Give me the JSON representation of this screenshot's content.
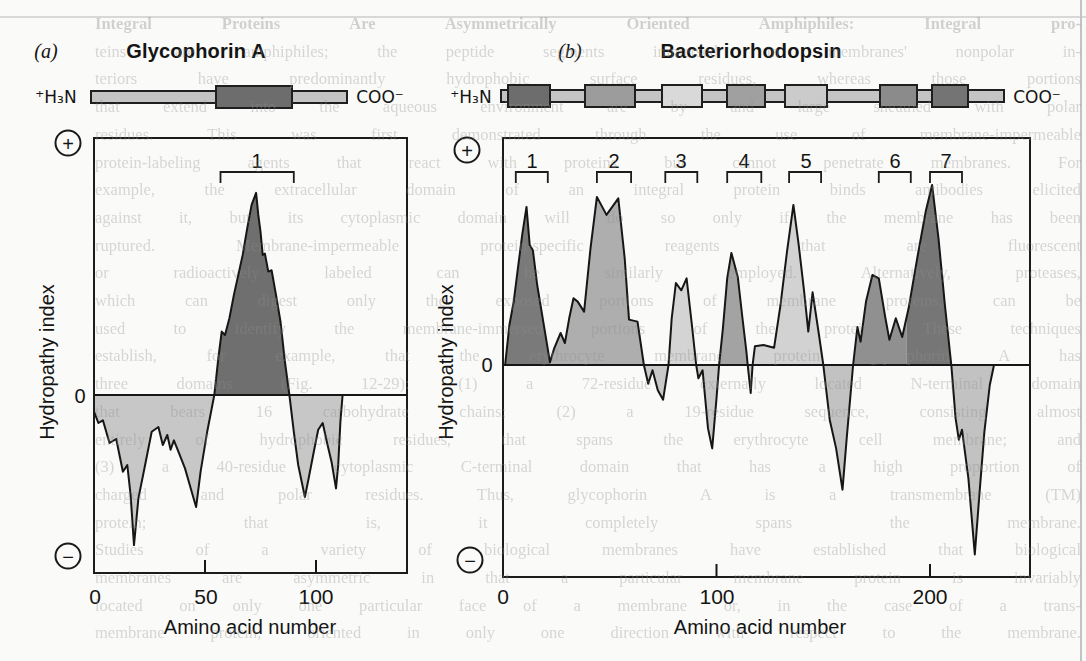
{
  "page": {
    "background": "#fafaf8",
    "bleed_lines": [
      "Integral Proteins Are Asymmetrically Oriented Amphiphiles: Integral pro-",
      "teins are amphiphiles; the peptide segments immersed in membranes' nonpolar in-",
      "teriors have predominantly hydrophobic surface residues, whereas those portions",
      "that extend into the aqueous environment are by and large sheathed with polar",
      "residues. This was first demonstrated through the use of membrane-impermeable",
      "protein-labeling agents that react with proteins but cannot penetrate membranes. For",
      "example, the extracellular domain of an integral protein binds antibodies elicited",
      "against it, but its cytoplasmic domain will do so only if the membrane has been",
      "ruptured. Membrane-impermeable protein-specific reagents that are fluorescent",
      "or radioactively labeled can be similarly employed. Alternatively, proteases,",
      "which can digest only the exposed portions of membrane proteins, can be",
      "used to identify the membrane-immersed portions of the protein. These techniques",
      "establish, for example, that the erythrocyte membrane protein glycophorin A has",
      "three domains (Fig. 12-29): (1) a 72-residue externally located N-terminal domain",
      "that bears 16 carbohydrate chains; (2) a 19-residue sequence, consisting almost",
      "entirely of hydrophobic residues, that spans the erythrocyte cell membrane; and",
      "(3) a 40-residue cytoplasmic C-terminal domain that has a high proportion of",
      "charged and polar residues. Thus, glycophorin A is a transmembrane (TM)",
      "protein; that is, it completely spans the membrane.",
      "Studies of a variety of biological membranes have established that biological",
      "membranes are asymmetric in that a particular membrane protein is invariably",
      "located on only one particular face of a membrane or, in the case of a trans-",
      "membrane protein, oriented in only one direction with respect to the membrane."
    ]
  },
  "panels": [
    {
      "panel_label": "(a)",
      "title": "Glycophorin A",
      "n_terminus": "⁺H₃N",
      "c_terminus": "COO⁻",
      "plus_symbol": "+",
      "minus_symbol": "−",
      "zero_label": "0",
      "ylabel": "Hydropathy index",
      "xlabel": "Amino acid number",
      "x_tick_labels": [
        "0",
        "50",
        "100"
      ],
      "diagram": {
        "bar": {
          "x": 90,
          "y": 90,
          "w": 258,
          "h": 14,
          "shade": "#c4c4c4"
        },
        "boxes": [
          {
            "x": 215,
            "y": 85,
            "w": 78,
            "h": 24,
            "shade": "#6d6d6d"
          }
        ]
      }
    },
    {
      "panel_label": "(b)",
      "title": "Bacteriorhodopsin",
      "n_terminus": "⁺H₃N",
      "c_terminus": "COO⁻",
      "plus_symbol": "+",
      "minus_symbol": "−",
      "zero_label": "0",
      "ylabel": "Hydropathy index",
      "xlabel": "Amino acid number",
      "x_tick_labels": [
        "0",
        "100",
        "200"
      ],
      "diagram": {
        "bar": {
          "x": 500,
          "y": 89,
          "w": 505,
          "h": 14,
          "shade": "#c4c4c4"
        },
        "boxes": [
          {
            "x": 507,
            "y": 84,
            "w": 44,
            "h": 24,
            "shade": "#6d6d6d"
          },
          {
            "x": 584,
            "y": 84,
            "w": 52,
            "h": 24,
            "shade": "#9c9c9c"
          },
          {
            "x": 661,
            "y": 84,
            "w": 42,
            "h": 24,
            "shade": "#d9d9d9"
          },
          {
            "x": 726,
            "y": 84,
            "w": 40,
            "h": 24,
            "shade": "#a0a0a0"
          },
          {
            "x": 784,
            "y": 84,
            "w": 44,
            "h": 24,
            "shade": "#cbcbcb"
          },
          {
            "x": 879,
            "y": 84,
            "w": 39,
            "h": 24,
            "shade": "#8b8b8b"
          },
          {
            "x": 931,
            "y": 84,
            "w": 38,
            "h": 24,
            "shade": "#747474"
          }
        ]
      }
    }
  ],
  "chart_data": [
    {
      "type": "area",
      "title": "Glycophorin A",
      "xlabel": "Amino acid number",
      "ylabel": "Hydropathy index",
      "x_ticks": [
        0,
        50,
        100
      ],
      "tick_marks_at": [
        50,
        100
      ],
      "xlim": [
        0,
        141
      ],
      "ylim": [
        -2.67,
        3.85
      ],
      "grid": false,
      "zero_line": 0,
      "line_color": "#161616",
      "brackets": [
        {
          "label": "1",
          "aa_start": 57,
          "aa_end": 90
        }
      ],
      "points": [
        [
          0,
          -0.25
        ],
        [
          2,
          -0.42
        ],
        [
          4,
          -0.38
        ],
        [
          7,
          -0.72
        ],
        [
          10,
          -0.66
        ],
        [
          13,
          -1.15
        ],
        [
          15,
          -1.05
        ],
        [
          16.5,
          -1.5
        ],
        [
          18,
          -2.25
        ],
        [
          20,
          -1.55
        ],
        [
          23,
          -1.05
        ],
        [
          26,
          -0.55
        ],
        [
          29,
          -0.48
        ],
        [
          31,
          -0.75
        ],
        [
          33,
          -0.6
        ],
        [
          34.5,
          -0.82
        ],
        [
          36,
          -0.68
        ],
        [
          38,
          -0.85
        ],
        [
          41,
          -1.1
        ],
        [
          44,
          -1.45
        ],
        [
          46,
          -1.68
        ],
        [
          48,
          -1.15
        ],
        [
          51,
          -0.55
        ],
        [
          54.2,
          0
        ],
        [
          56,
          0.55
        ],
        [
          57.5,
          0.95
        ],
        [
          59,
          0.9
        ],
        [
          61,
          1.15
        ],
        [
          63,
          1.5
        ],
        [
          65,
          1.8
        ],
        [
          67,
          2.1
        ],
        [
          69,
          2.5
        ],
        [
          71,
          2.85
        ],
        [
          73,
          3.03
        ],
        [
          74,
          2.7
        ],
        [
          75,
          2.45
        ],
        [
          76,
          2.1
        ],
        [
          77,
          2.12
        ],
        [
          78.5,
          1.85
        ],
        [
          80,
          1.87
        ],
        [
          82,
          1.5
        ],
        [
          84,
          1.1
        ],
        [
          86,
          0.5
        ],
        [
          88,
          0
        ],
        [
          90,
          -0.55
        ],
        [
          92,
          -1.05
        ],
        [
          95,
          -1.53
        ],
        [
          97,
          -1.2
        ],
        [
          99,
          -0.85
        ],
        [
          101,
          -0.52
        ],
        [
          103,
          -0.42
        ],
        [
          105,
          -0.72
        ],
        [
          107,
          -1.0
        ],
        [
          109,
          -1.4
        ],
        [
          110,
          -1.05
        ],
        [
          111,
          -0.4
        ],
        [
          112,
          0
        ]
      ],
      "fill_segments": [
        {
          "from": 0,
          "to": 54.2,
          "color": "#c7c7c7"
        },
        {
          "from": 54.2,
          "to": 88,
          "color": "#6f6f6f"
        },
        {
          "from": 88,
          "to": 112,
          "color": "#c7c7c7"
        }
      ]
    },
    {
      "type": "area",
      "title": "Bacteriorhodopsin",
      "xlabel": "Amino acid number",
      "ylabel": "Hydropathy index",
      "x_ticks": [
        0,
        100,
        200
      ],
      "tick_marks_at": [
        100,
        200
      ],
      "xlim": [
        0,
        247
      ],
      "ylim": [
        -3.18,
        3.4
      ],
      "grid": false,
      "zero_line": 0,
      "line_color": "#161616",
      "brackets": [
        {
          "label": "1",
          "aa_start": 6,
          "aa_end": 21
        },
        {
          "label": "2",
          "aa_start": 44,
          "aa_end": 60
        },
        {
          "label": "3",
          "aa_start": 76,
          "aa_end": 91
        },
        {
          "label": "4",
          "aa_start": 105,
          "aa_end": 121
        },
        {
          "label": "5",
          "aa_start": 134,
          "aa_end": 149
        },
        {
          "label": "6",
          "aa_start": 176,
          "aa_end": 191
        },
        {
          "label": "7",
          "aa_start": 200,
          "aa_end": 215
        }
      ],
      "points": [
        [
          1,
          0
        ],
        [
          3,
          0.6
        ],
        [
          5,
          0.95
        ],
        [
          7,
          1.45
        ],
        [
          9,
          1.95
        ],
        [
          11,
          2.37
        ],
        [
          12.5,
          1.8
        ],
        [
          14,
          1.72
        ],
        [
          16,
          1.2
        ],
        [
          19,
          0.62
        ],
        [
          22,
          0.04
        ],
        [
          24,
          0.25
        ],
        [
          27,
          0.48
        ],
        [
          29,
          0.33
        ],
        [
          31,
          0.7
        ],
        [
          33,
          1.0
        ],
        [
          35,
          0.95
        ],
        [
          38,
          0.8
        ],
        [
          41,
          1.75
        ],
        [
          44,
          2.52
        ],
        [
          48.5,
          2.25
        ],
        [
          54,
          2.5
        ],
        [
          57,
          1.6
        ],
        [
          59,
          0.68
        ],
        [
          63,
          0.65
        ],
        [
          66,
          0
        ],
        [
          68,
          -0.28
        ],
        [
          70,
          -0.08
        ],
        [
          72.5,
          -0.38
        ],
        [
          75,
          -0.52
        ],
        [
          77.5,
          0
        ],
        [
          79,
          0.7
        ],
        [
          81,
          1.23
        ],
        [
          83.5,
          1.12
        ],
        [
          86,
          1.3
        ],
        [
          88.5,
          0.6
        ],
        [
          90.5,
          0
        ],
        [
          91.5,
          -0.2
        ],
        [
          93.5,
          -0.08
        ],
        [
          96,
          -0.95
        ],
        [
          98,
          -1.25
        ],
        [
          100,
          -0.5
        ],
        [
          101.2,
          0
        ],
        [
          103,
          0.55
        ],
        [
          105,
          1.3
        ],
        [
          107,
          1.68
        ],
        [
          110,
          1.32
        ],
        [
          112,
          0.75
        ],
        [
          114,
          0.2
        ],
        [
          114.6,
          0
        ],
        [
          116,
          -0.42
        ],
        [
          116.9,
          0
        ],
        [
          118,
          0.28
        ],
        [
          122,
          0.3
        ],
        [
          127,
          0.26
        ],
        [
          130,
          0.9
        ],
        [
          133,
          1.7
        ],
        [
          136,
          2.4
        ],
        [
          138.5,
          1.8
        ],
        [
          141,
          1.12
        ],
        [
          143,
          0.5
        ],
        [
          145,
          1.09
        ],
        [
          148,
          0.45
        ],
        [
          150,
          0
        ],
        [
          153,
          -0.82
        ],
        [
          156,
          -1.25
        ],
        [
          159,
          -1.87
        ],
        [
          161,
          -1.1
        ],
        [
          164,
          0
        ],
        [
          166,
          0.57
        ],
        [
          167.5,
          0.35
        ],
        [
          170,
          0.95
        ],
        [
          173,
          1.35
        ],
        [
          176,
          1.3
        ],
        [
          179,
          0.72
        ],
        [
          181,
          0.38
        ],
        [
          184,
          0.7
        ],
        [
          187,
          0.42
        ],
        [
          190,
          0.85
        ],
        [
          194,
          1.6
        ],
        [
          198,
          2.3
        ],
        [
          201,
          2.7
        ],
        [
          204,
          1.9
        ],
        [
          207,
          0.9
        ],
        [
          210,
          0
        ],
        [
          212,
          -0.8
        ],
        [
          213.5,
          -1.12
        ],
        [
          215,
          -0.97
        ],
        [
          218,
          -1.7
        ],
        [
          221,
          -2.84
        ],
        [
          223,
          -2.0
        ],
        [
          225.5,
          -1.0
        ],
        [
          228,
          -0.3
        ],
        [
          230,
          0
        ]
      ],
      "fill_segments": [
        {
          "from": 1,
          "to": 22,
          "color": "#7a7a7a"
        },
        {
          "from": 22,
          "to": 66,
          "color": "#aeaeae"
        },
        {
          "from": 66,
          "to": 77.5,
          "color": "#c8c8c8"
        },
        {
          "from": 77.5,
          "to": 90.5,
          "color": "#d4d4d4"
        },
        {
          "from": 90.5,
          "to": 101.2,
          "color": "#c8c8c8"
        },
        {
          "from": 101.2,
          "to": 114.6,
          "color": "#a3a3a3"
        },
        {
          "from": 114.6,
          "to": 116.9,
          "color": "#c8c8c8"
        },
        {
          "from": 116.9,
          "to": 150,
          "color": "#d2d2d2"
        },
        {
          "from": 150,
          "to": 164,
          "color": "#c2c2c2"
        },
        {
          "from": 164,
          "to": 189,
          "color": "#909090"
        },
        {
          "from": 189,
          "to": 210,
          "color": "#767676"
        },
        {
          "from": 210,
          "to": 230,
          "color": "#c2c2c2"
        }
      ]
    }
  ]
}
